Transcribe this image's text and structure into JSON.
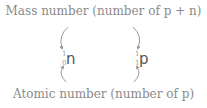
{
  "labels": {
    "top": "Mass number (number of p + n)",
    "bottom": "Atomic number (number of p)"
  },
  "nuclides": [
    {
      "name": "neutron",
      "symbol": "n",
      "mass_number": "1",
      "atomic_number": "0"
    },
    {
      "name": "proton",
      "symbol": "p",
      "mass_number": "1",
      "atomic_number": "1"
    }
  ],
  "colors": {
    "label": "#8a8a8a",
    "symbol": "#555555",
    "arrow": "#999999"
  }
}
